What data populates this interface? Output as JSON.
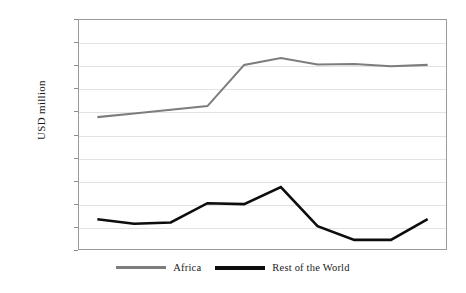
{
  "chart_data": {
    "type": "line",
    "title": "",
    "xlabel": "",
    "ylabel": "USD million",
    "x": [
      "2006",
      "2007",
      "2008",
      "2008",
      "2010",
      "2011",
      "2012",
      "2013",
      "2014",
      "2015"
    ],
    "xtick_labels": [
      "2006",
      "2007",
      "2008",
      "2008",
      "2010",
      "2011",
      "2012",
      "2013",
      "2014",
      "2015"
    ],
    "ytick_labels": [
      "25 000",
      "20 000",
      "15 000",
      "10 000",
      "5 000",
      "0",
      "5 000",
      "-10 000",
      "-15 000",
      "-20 000",
      "-25 000"
    ],
    "ytick_values": [
      25000,
      20000,
      15000,
      10000,
      5000,
      0,
      -5000,
      -10000,
      -15000,
      -20000,
      -25000
    ],
    "ylim": [
      -25000,
      25000
    ],
    "grid": true,
    "legend_position": "bottom-center",
    "series": [
      {
        "name": "Africa",
        "color": "#7d7d7d",
        "values": [
          3800,
          4600,
          5400,
          6200,
          15200,
          16700,
          15300,
          15400,
          14900,
          15200
        ]
      },
      {
        "name": "Rest of the World",
        "color": "#0d0d0d",
        "values": [
          -18500,
          -19500,
          -19200,
          -15000,
          -15200,
          -11500,
          -20000,
          -23000,
          -23000,
          -18500
        ]
      }
    ]
  },
  "legend": {
    "items": [
      {
        "label": "Africa",
        "color": "#7d7d7d"
      },
      {
        "label": "Rest of the World",
        "color": "#0d0d0d"
      }
    ]
  }
}
